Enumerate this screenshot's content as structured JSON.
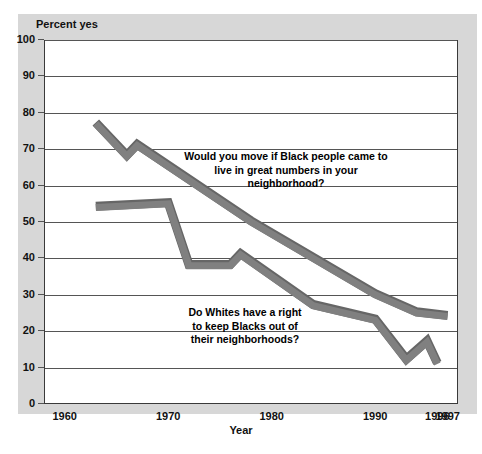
{
  "chart_data": {
    "type": "line",
    "title": "",
    "ylabel": "Percent yes",
    "xlabel": "Year",
    "ylim": [
      0,
      100
    ],
    "xlim": [
      1958,
      1998
    ],
    "grid": true,
    "legend_position": "inline-annotations",
    "ytick_labels": [
      "100",
      "90",
      "80",
      "70",
      "60",
      "50",
      "40",
      "30",
      "20",
      "10",
      "0"
    ],
    "ytick_values": [
      100,
      90,
      80,
      70,
      60,
      50,
      40,
      30,
      20,
      10,
      0
    ],
    "xtick_labels": [
      "1960",
      "1970",
      "1980",
      "1990",
      "1996",
      "1997"
    ],
    "xtick_values": [
      1960,
      1970,
      1980,
      1990,
      1996,
      1997
    ],
    "series": [
      {
        "name": "Would you move if Black people came to live in great numbers in your neighborhood?",
        "annotation": "Would you move if Black people came to\nlive in great numbers in your\nneighborhood?",
        "color": "#808080",
        "x": [
          1963,
          1966,
          1967,
          1978,
          1990,
          1994,
          1997
        ],
        "values": [
          77,
          68,
          71,
          50,
          30,
          25,
          24
        ]
      },
      {
        "name": "Do Whites have a right to keep Blacks out of their neighborhoods?",
        "annotation": "Do Whites have a right\nto keep Blacks out of\ntheir neighborhoods?",
        "color": "#808080",
        "x": [
          1963,
          1970,
          1972,
          1976,
          1977,
          1984,
          1990,
          1993,
          1995,
          1996
        ],
        "values": [
          54,
          55,
          38,
          38,
          41,
          27,
          23,
          12,
          17,
          11
        ]
      }
    ]
  },
  "colors": {
    "panel_background": "#d7d7d7",
    "plot_background": "#ffffff",
    "line": "#808080",
    "line_shadow": "#666666",
    "grid": "#555555",
    "text": "#111111"
  },
  "axis": {
    "y_title": "Percent yes",
    "x_title": "Year"
  },
  "annotations": {
    "upper": "Would you move if Black people came to\nlive in great numbers in your\nneighborhood?",
    "lower": "Do Whites have a right\nto keep Blacks out of\ntheir neighborhoods?"
  }
}
